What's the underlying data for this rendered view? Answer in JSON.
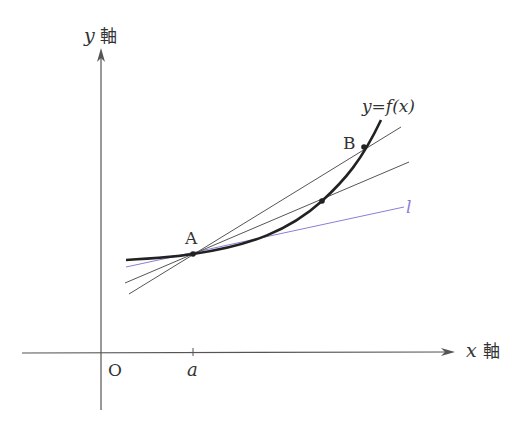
{
  "diagram": {
    "title": "",
    "axes": {
      "y_label_var": "y",
      "y_label_suffix": "軸",
      "x_label_var": "x",
      "x_label_suffix": "軸",
      "origin_label": "O",
      "tick_a_label": "a"
    },
    "curve_label": "y=f(x)",
    "points": {
      "A": "A",
      "B": "B"
    },
    "tangent_label": "l",
    "colors": {
      "axis": "#555555",
      "curve": "#222222",
      "secant": "#555555",
      "tangent": "#8a7fd6"
    }
  }
}
